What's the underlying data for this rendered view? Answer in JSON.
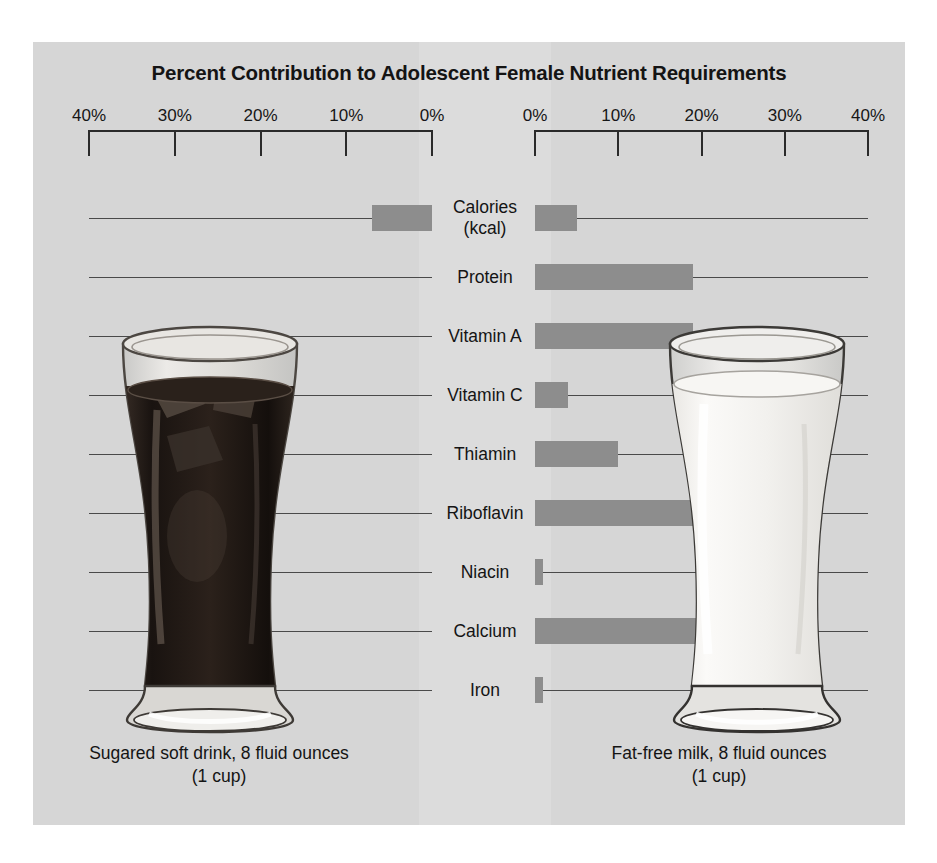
{
  "title": "Percent Contribution to Adolescent Female Nutrient Requirements",
  "axes": {
    "left_ticks": [
      "40%",
      "30%",
      "20%",
      "10%",
      "0%"
    ],
    "right_ticks": [
      "0%",
      "10%",
      "20%",
      "30%",
      "40%"
    ],
    "max_percent": 40,
    "tick_step": 10
  },
  "captions": {
    "left_line1": "Sugared soft drink, 8 fluid ounces",
    "left_line2": "(1 cup)",
    "right_line1": "Fat-free milk, 8 fluid ounces",
    "right_line2": "(1 cup)"
  },
  "colors": {
    "panel": "#d6d6d6",
    "centre_strip": "#dcdcdc",
    "bar": "#8d8d8d",
    "axis": "#2a2a2a",
    "row_line": "#4a4a4a",
    "text": "#141414",
    "cola": "#241c18",
    "milk": "#f4f3f0"
  },
  "chart_data": {
    "type": "bar",
    "title": "Percent Contribution to Adolescent Female Nutrient Requirements",
    "orientation": "horizontal-diverging",
    "xlabel": "",
    "ylabel": "",
    "xlim": [
      0,
      40
    ],
    "xunit": "%",
    "grid": true,
    "legend_position": "below-panels",
    "categories": [
      "Calories (kcal)",
      "Protein",
      "Vitamin A",
      "Vitamin C",
      "Thiamin",
      "Riboflavin",
      "Niacin",
      "Calcium",
      "Iron"
    ],
    "series": [
      {
        "name": "Sugared soft drink, 8 fluid ounces (1 cup)",
        "side": "left",
        "values": [
          7,
          0,
          0,
          0,
          0,
          0,
          0,
          0,
          0
        ]
      },
      {
        "name": "Fat-free milk, 8 fluid ounces (1 cup)",
        "side": "right",
        "values": [
          5,
          19,
          19,
          4,
          10,
          23.5,
          1,
          27,
          1
        ]
      }
    ]
  }
}
